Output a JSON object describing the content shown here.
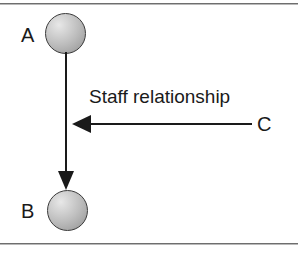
{
  "diagram": {
    "frame": {
      "top_rule": "horizontal-rule",
      "bottom_rule": "horizontal-rule"
    },
    "nodes": [
      {
        "id": "A",
        "label": "A",
        "shape": "sphere",
        "fill": "#bdbdbd",
        "stroke": "#3a3a3a"
      },
      {
        "id": "B",
        "label": "B",
        "shape": "sphere",
        "fill": "#bdbdbd",
        "stroke": "#3a3a3a"
      }
    ],
    "actors": [
      {
        "id": "C",
        "label": "C"
      }
    ],
    "edges": [
      {
        "id": "a-to-b",
        "from": "A",
        "to": "B",
        "direction": "down",
        "arrowhead": "filled-triangle",
        "caption": ""
      },
      {
        "id": "c-to-line",
        "from": "C",
        "to": "a-to-b",
        "direction": "left",
        "arrowhead": "filled-triangle",
        "caption": "Staff relationship"
      }
    ],
    "colors": {
      "line": "#1a1a1a",
      "text": "#1a1a1a",
      "rule": "#6e6e6e",
      "background": "#ffffff"
    }
  }
}
